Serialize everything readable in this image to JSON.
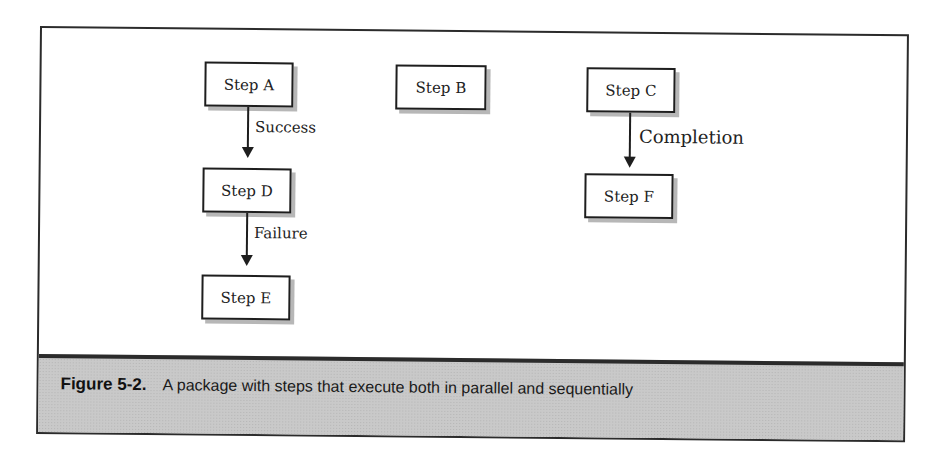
{
  "diagram": {
    "nodes": [
      {
        "id": "A",
        "label": "Step A"
      },
      {
        "id": "B",
        "label": "Step B"
      },
      {
        "id": "C",
        "label": "Step C"
      },
      {
        "id": "D",
        "label": "Step D"
      },
      {
        "id": "E",
        "label": "Step E"
      },
      {
        "id": "F",
        "label": "Step F"
      }
    ],
    "edges": [
      {
        "from": "A",
        "to": "D",
        "label": "Success"
      },
      {
        "from": "D",
        "to": "E",
        "label": "Failure"
      },
      {
        "from": "C",
        "to": "F",
        "label": "Completion"
      }
    ]
  },
  "caption": {
    "number": "Figure 5-2.",
    "text": "A package with steps that execute both in parallel and sequentially"
  },
  "colors": {
    "border": "#2b2b2b",
    "caption_bg": "#c9c9c9",
    "box_shadow": "#b7b7b7"
  }
}
